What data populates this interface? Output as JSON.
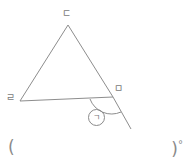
{
  "figure": {
    "type": "triangle-with-exterior-angle",
    "stroke_color": "#8a8a8a",
    "background_color": "#ffffff",
    "vertices": {
      "apex_label": "ㄷ",
      "bottom_left_label": "ㄹ",
      "bottom_right_label": "ㅁ"
    },
    "angle_marker": {
      "label": "㉠",
      "inner_label": "ㄱ",
      "description": "exterior-angle-below-base-at-right-vertex"
    },
    "extended_line": {
      "description": "base extended beyond bottom-right vertex toward lower right"
    },
    "geometry": {
      "apex": [
        68,
        25
      ],
      "bottom_left": [
        20,
        101
      ],
      "bottom_right": [
        113,
        97
      ],
      "extension_end": [
        131,
        129
      ]
    }
  },
  "answer": {
    "open_paren": "(",
    "close_paren": ")",
    "degree_symbol": "°",
    "value": ""
  }
}
